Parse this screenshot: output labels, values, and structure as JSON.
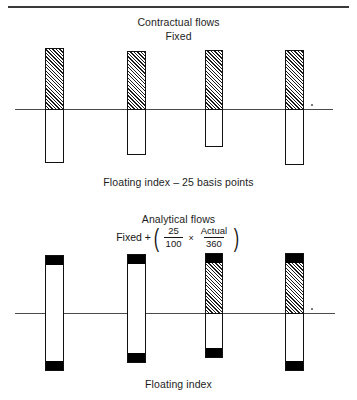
{
  "figure": {
    "top_rule": true,
    "upper": {
      "title": "Contractual flows",
      "subtitle": "Fixed",
      "footer": "Floating index – 25 basis points",
      "axis_label": ""
    },
    "lower": {
      "title": "Analytical flows",
      "footer": "Floating index",
      "formula": {
        "lead": "Fixed +",
        "open_paren": "(",
        "close_paren": ")",
        "operator": "×",
        "fraction_1": {
          "numerator": "25",
          "denominator": "100"
        },
        "fraction_2": {
          "numerator": "Actual",
          "denominator": "360"
        }
      }
    }
  },
  "chart_data": [
    {
      "type": "bar",
      "title": "Contractual flows",
      "subtitle": "Fixed",
      "xlabel": "Floating index – 25 basis points",
      "ylabel": "",
      "grid": false,
      "legend": "none",
      "axis_y_zero_px": 69,
      "note": "Four payment periods. Positive (hatched) fixed leg above the zero axis, negative (white) floating leg below.",
      "categories": [
        "period-1",
        "period-2",
        "period-3",
        "period-4"
      ],
      "series": [
        {
          "name": "Fixed (hatched, above axis)",
          "values": [
            21,
            18,
            19,
            19
          ]
        },
        {
          "name": "Floating index – 25bp (white, below axis)",
          "values": [
            -54,
            -46,
            -38,
            -54
          ]
        }
      ]
    },
    {
      "type": "bar",
      "title": "Analytical flows",
      "subtitle": "Fixed + ( 25/100 × Actual/360 )",
      "xlabel": "Floating index",
      "ylabel": "",
      "grid": false,
      "legend": "none",
      "axis_y_zero_px": 65,
      "note": "Four periods. Solid black caps mark the accrual adjustment at top and bottom; hatched band in periods 3 and 4 represents the fixed leg above the axis.",
      "categories": [
        "period-1",
        "period-2",
        "period-3",
        "period-4"
      ],
      "series": [
        {
          "name": "Black cap top (accrual adjustment)",
          "values": [
            9,
            9,
            9,
            9
          ]
        },
        {
          "name": "Fixed hatched (above axis)",
          "values": [
            0,
            0,
            51,
            51
          ]
        },
        {
          "name": "White body",
          "values": [
            49,
            49,
            0,
            0
          ]
        },
        {
          "name": "White body below axis",
          "values": [
            -49,
            -41,
            -36,
            -49
          ]
        },
        {
          "name": "Black cap bottom (accrual adjustment)",
          "values": [
            -9,
            -9,
            -9,
            -9
          ]
        }
      ]
    }
  ],
  "bars": {
    "upper": [
      {
        "name": "bar-1",
        "left": 45,
        "width": 19,
        "top": 8,
        "height": 115,
        "hatch_height": 61
      },
      {
        "name": "bar-2",
        "left": 127,
        "width": 19,
        "top": 11,
        "height": 104,
        "hatch_height": 58
      },
      {
        "name": "bar-3",
        "left": 205,
        "width": 18,
        "top": 10,
        "height": 97,
        "hatch_height": 59
      },
      {
        "name": "bar-4",
        "left": 285,
        "width": 19,
        "top": 10,
        "height": 115,
        "hatch_height": 59
      }
    ],
    "lower": [
      {
        "name": "bar-1",
        "left": 45,
        "width": 19,
        "top": 7,
        "height": 116,
        "cap_top": 9,
        "hatch_height": 0,
        "cap_bottom": 9
      },
      {
        "name": "bar-2",
        "left": 127,
        "width": 19,
        "top": 6,
        "height": 109,
        "cap_top": 9,
        "hatch_height": 0,
        "cap_bottom": 9
      },
      {
        "name": "bar-3",
        "left": 205,
        "width": 18,
        "top": 5,
        "height": 105,
        "cap_top": 9,
        "hatch_height": 51,
        "cap_bottom": 9
      },
      {
        "name": "bar-4",
        "left": 285,
        "width": 19,
        "top": 5,
        "height": 118,
        "cap_top": 9,
        "hatch_height": 51,
        "cap_bottom": 9
      }
    ]
  }
}
